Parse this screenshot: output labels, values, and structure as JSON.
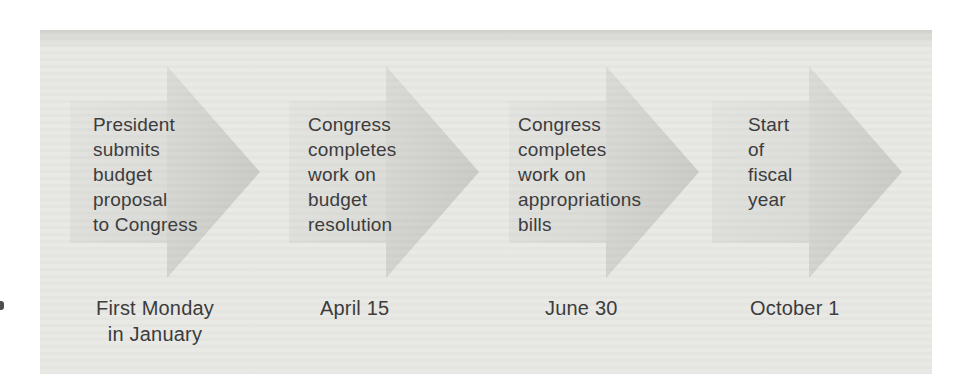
{
  "figure": {
    "type": "process-timeline",
    "steps": [
      {
        "label": "President\nsubmits\nbudget\nproposal\nto Congress",
        "date": "First Monday\nin January"
      },
      {
        "label": "Congress\ncompletes\nwork on\nbudget\nresolution",
        "date": "April 15"
      },
      {
        "label": "Congress\ncompletes\nwork on\nappropriations\nbills",
        "date": "June 30"
      },
      {
        "label": "Start\nof\nfiscal\nyear",
        "date": "October 1"
      }
    ],
    "colors": {
      "page_background": "#ffffff",
      "panel_background": "#e8e8e5",
      "arrow_shaft": "#dededb",
      "arrow_head": "#d0d0cd",
      "text": "#3a3a3a"
    }
  }
}
